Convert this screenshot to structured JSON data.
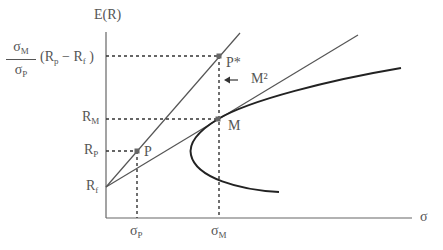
{
  "diagram": {
    "axes": {
      "y_label": "E(R)",
      "x_label": "σ",
      "y_ticks": [
        {
          "name": "scaled-return",
          "num": "σ",
          "num_sub": "M",
          "den": "σ",
          "den_sub": "P",
          "rest": "(R",
          "rest_sub1": "p",
          "rest_mid": " − R",
          "rest_sub2": "f",
          "rest_end": " )"
        },
        {
          "main": "R",
          "sub": "M"
        },
        {
          "main": "R",
          "sub": "P"
        },
        {
          "main": "R",
          "sub": "f"
        }
      ],
      "x_ticks": [
        {
          "main": "σ",
          "sub": "P"
        },
        {
          "main": "σ",
          "sub": "M"
        }
      ]
    },
    "points": {
      "p": "P",
      "p_star": "P*",
      "m": "M"
    },
    "annotation": {
      "m2_label": "M²"
    },
    "colors": {
      "lines": "#555555",
      "frontier": "#222222",
      "dots": "#666666"
    }
  }
}
